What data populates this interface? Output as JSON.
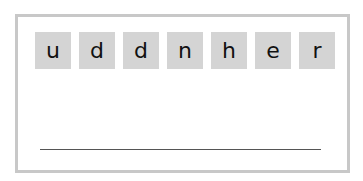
{
  "puzzle": {
    "tiles": [
      "u",
      "d",
      "d",
      "n",
      "h",
      "e",
      "r"
    ],
    "answer": ""
  },
  "colors": {
    "tile_bg": "#d4d4d4",
    "border": "#c8c8c8",
    "line": "#555555"
  }
}
